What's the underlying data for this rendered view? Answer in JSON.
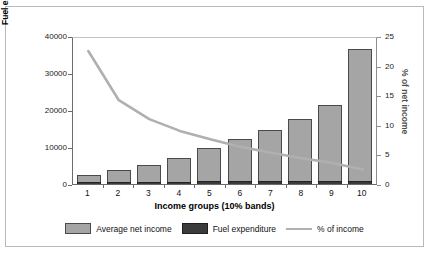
{
  "chart_data": {
    "type": "bar",
    "title": "",
    "xlabel": "Income groups (10% bands)",
    "ylabel": "Fuel expenditure & net income (£)",
    "y2label": "% of net income",
    "categories": [
      "1",
      "2",
      "3",
      "4",
      "5",
      "6",
      "7",
      "8",
      "9",
      "10"
    ],
    "ylim": [
      0,
      40000
    ],
    "yticks": [
      "0",
      "10000",
      "20000",
      "30000",
      "40000"
    ],
    "y2lim": [
      0,
      25
    ],
    "y2ticks": [
      "0",
      "5",
      "10",
      "15",
      "20",
      "25"
    ],
    "grid": false,
    "legend_position": "bottom",
    "series": [
      {
        "name": "Average net income",
        "type": "bar",
        "axis": "left",
        "color": "#a5a5a5",
        "values": [
          2400,
          3700,
          5200,
          7100,
          9800,
          12200,
          14700,
          17700,
          21400,
          36500
        ]
      },
      {
        "name": "Fuel expenditure",
        "type": "bar",
        "axis": "left",
        "color": "#3b3b3b",
        "values": [
          550,
          600,
          620,
          660,
          700,
          720,
          760,
          800,
          840,
          900
        ]
      },
      {
        "name": "% of income",
        "type": "line",
        "axis": "right",
        "color": "#b0b0b0",
        "values": [
          22.8,
          14.5,
          11.3,
          9.3,
          7.9,
          6.6,
          5.6,
          4.7,
          3.9,
          2.8
        ]
      }
    ]
  },
  "axes": {
    "left_title": "Fuel expenditure & net income (£)",
    "right_title": "% of net income",
    "x_title": "Income groups (10% bands)"
  },
  "legend": {
    "items": [
      {
        "label": "Average net income",
        "swatch": "net-income-swatch"
      },
      {
        "label": "Fuel expenditure",
        "swatch": "fuel-expenditure-swatch"
      },
      {
        "label": "% of income",
        "swatch": "percent-line-swatch"
      }
    ]
  },
  "colors": {
    "net_income": "#a5a5a5",
    "fuel_expenditure": "#3b3b3b",
    "percent_line": "#b0b0b0",
    "frame": "#b9b9b9",
    "axis": "#6b6b6b"
  }
}
